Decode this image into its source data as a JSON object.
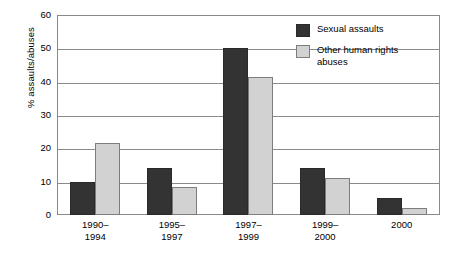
{
  "chart_data": {
    "type": "bar",
    "title": "",
    "xlabel": "",
    "ylabel": "% assaults/abuses",
    "ylim": [
      0,
      60
    ],
    "yticks": [
      0,
      10,
      20,
      30,
      40,
      50,
      60
    ],
    "grid": true,
    "legend_position": "top-right",
    "categories": [
      "1990–\n1994",
      "1995–\n1997",
      "1997–\n1999",
      "1999–\n2000",
      "2000"
    ],
    "category_lines": [
      [
        "1990–",
        "1994"
      ],
      [
        "1995–",
        "1997"
      ],
      [
        "1997–",
        "1999"
      ],
      [
        "1999–",
        "2000"
      ],
      [
        "2000",
        ""
      ]
    ],
    "series": [
      {
        "name": "Sexual assaults",
        "color": "#333333",
        "values": [
          10,
          14,
          50,
          14,
          5
        ]
      },
      {
        "name": "Other human rights abuses",
        "color": "#d2d2d2",
        "values": [
          21.5,
          8.5,
          41.5,
          11,
          2
        ]
      }
    ]
  },
  "legend": {
    "items": [
      {
        "label": "Sexual assaults",
        "swatch": "dark"
      },
      {
        "label": "Other human rights\nabuses",
        "swatch": "light"
      }
    ]
  },
  "axis": {
    "y_title": "% assaults/abuses",
    "y_tick_labels": [
      "60",
      "50",
      "40",
      "30",
      "20",
      "10",
      "0"
    ],
    "x_tick_labels": [
      {
        "line1": "1990–",
        "line2": "1994"
      },
      {
        "line1": "1995–",
        "line2": "1997"
      },
      {
        "line1": "1997–",
        "line2": "1999"
      },
      {
        "line1": "1999–",
        "line2": "2000"
      },
      {
        "line1": "2000",
        "line2": ""
      }
    ]
  }
}
